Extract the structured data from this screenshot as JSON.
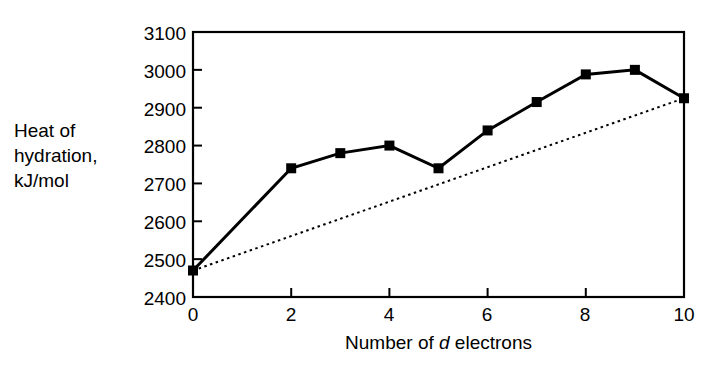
{
  "chart_data": {
    "type": "line",
    "title": "",
    "xlabel_parts": {
      "pre": "Number of ",
      "italic": "d",
      "post": " electrons"
    },
    "xlabel": "Number of d electrons",
    "ylabel_lines": [
      "Heat of",
      "hydration,",
      "kJ/mol"
    ],
    "ylabel": "Heat of hydration, kJ/mol",
    "xlim": [
      0,
      10
    ],
    "ylim": [
      2400,
      3100
    ],
    "xticks": [
      0,
      2,
      4,
      6,
      8,
      10
    ],
    "xtick_labels": [
      "0",
      "2",
      "4",
      "6",
      "8",
      "10"
    ],
    "yticks": [
      2400,
      2500,
      2600,
      2700,
      2800,
      2900,
      3000,
      3100
    ],
    "ytick_labels": [
      "2400",
      "2500",
      "2600",
      "2700",
      "2800",
      "2900",
      "3000",
      "3100"
    ],
    "grid": false,
    "legend": false,
    "series": [
      {
        "name": "Measured heat of hydration",
        "style": "solid",
        "marker": "filled-square",
        "color": "#000000",
        "x": [
          0,
          2,
          3,
          4,
          5,
          6,
          7,
          8,
          9,
          10
        ],
        "values": [
          2470,
          2740,
          2780,
          2800,
          2740,
          2840,
          2915,
          2988,
          3000,
          2925
        ]
      },
      {
        "name": "Reference trend line",
        "style": "dotted",
        "marker": "none",
        "color": "#000000",
        "x": [
          0,
          10
        ],
        "values": [
          2470,
          2925
        ]
      }
    ],
    "annotations": []
  },
  "figure": {
    "background_color": "#ffffff",
    "axis_color": "#000000"
  }
}
